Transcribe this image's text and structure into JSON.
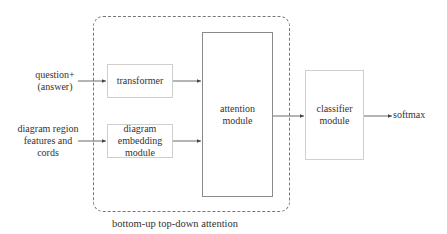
{
  "diagram": {
    "inputs": {
      "question": "question+\n(answer)",
      "question_line1": "question+",
      "question_line2": "(answer)",
      "diagram_line1": "diagram region",
      "diagram_line2": "features and",
      "diagram_line3": "cords"
    },
    "modules": {
      "transformer": "transformer",
      "diagram_embedding_line1": "diagram",
      "diagram_embedding_line2": "embedding",
      "diagram_embedding_line3": "module",
      "attention_line1": "attention",
      "attention_line2": "module",
      "classifier_line1": "classifier",
      "classifier_line2": "module"
    },
    "output": "softmax",
    "group_caption": "bottom-up top-down attention",
    "colors": {
      "dashed_border": "#777777",
      "box_border_light": "#cfcfcf",
      "box_border_dark": "#8a8a8a",
      "arrow": "#444444",
      "text": "#333333"
    }
  }
}
